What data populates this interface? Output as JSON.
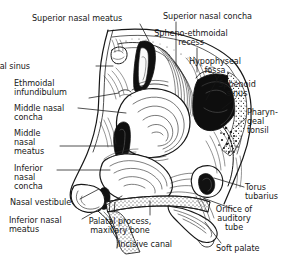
{
  "figure": {
    "style": "pen-and-ink anatomical line drawing, black on white",
    "width": 303,
    "height": 265,
    "ink_color": "#171717",
    "background_color": "#ffffff"
  },
  "labels": [
    {
      "id": "superior-nasal-meatus",
      "text": "Superior nasal meatus",
      "lines": [
        "Superior nasal meatus"
      ],
      "align": "left",
      "x": 32,
      "y": 14,
      "leader": {
        "from": [
          140,
          24
        ],
        "to": [
          149,
          41
        ]
      }
    },
    {
      "id": "superior-nasal-concha",
      "text": "Superior nasal concha",
      "lines": [
        "Superior nasal concha"
      ],
      "align": "left",
      "x": 163,
      "y": 12,
      "leader": {
        "from": [
          176,
          22
        ],
        "to": [
          176,
          66
        ]
      }
    },
    {
      "id": "spheno-ethmoidal-recess",
      "text": "Spheno-ethmoidal recess",
      "lines": [
        "Spheno-ethmoidal",
        "recess"
      ],
      "align": "center",
      "x": 191,
      "y": 29,
      "leader": {
        "from": [
          197,
          48
        ],
        "to": [
          197,
          72
        ]
      }
    },
    {
      "id": "hypophyseal-fossa",
      "text": "Hypophyseal fossa",
      "lines": [
        "Hypophyseal",
        "fossa"
      ],
      "align": "center",
      "x": 215,
      "y": 57,
      "leader": {
        "from": [
          219,
          76
        ],
        "to": [
          206,
          100
        ]
      }
    },
    {
      "id": "sphenoid-sinus",
      "text": "Sphenoid sinus",
      "lines": [
        "Sphenoid",
        "sinus"
      ],
      "align": "center",
      "x": 237,
      "y": 80,
      "leader": {
        "from": [
          236,
          98
        ],
        "to": [
          222,
          109
        ]
      }
    },
    {
      "id": "pharyngeal-tonsil",
      "text": "Pharyngeal tonsil",
      "lines": [
        "Pharyn-",
        "geal",
        "tonsil"
      ],
      "align": "left",
      "x": 247,
      "y": 108,
      "leader": {
        "from": [
          246,
          118
        ],
        "to": [
          236,
          127
        ]
      }
    },
    {
      "id": "torus-tubarius",
      "text": "Torus tubarius",
      "lines": [
        "Torus",
        "tubarius"
      ],
      "align": "left",
      "x": 245,
      "y": 183,
      "leader": {
        "from": [
          244,
          187
        ],
        "to": [
          214,
          178
        ]
      }
    },
    {
      "id": "orifice-of-auditory-tube",
      "text": "Orifice of auditory tube",
      "lines": [
        "Orifice of",
        "auditory",
        "tube"
      ],
      "align": "center",
      "x": 234,
      "y": 205,
      "leader": {
        "from": [
          233,
          209
        ],
        "to": [
          203,
          198
        ]
      }
    },
    {
      "id": "soft-palate",
      "text": "Soft palate",
      "lines": [
        "Soft palate"
      ],
      "align": "left",
      "x": 216,
      "y": 244,
      "leader": {
        "from": [
          221,
          243
        ],
        "to": [
          205,
          222
        ]
      }
    },
    {
      "id": "frontal-sinus",
      "text": "Frontal sinus",
      "lines": [
        "Frontal sinus"
      ],
      "align": "right",
      "x": 30,
      "y": 62,
      "leader": {
        "from": [
          96,
          66
        ],
        "to": [
          113,
          66
        ]
      }
    },
    {
      "id": "ethmoidal-infundibulum",
      "text": "Ethmoidal infundibulum",
      "lines": [
        "Ethmoidal",
        "infundibulum"
      ],
      "align": "left",
      "x": 14,
      "y": 79,
      "leader": {
        "from": [
          89,
          98
        ],
        "to": [
          119,
          93
        ]
      }
    },
    {
      "id": "middle-nasal-concha",
      "text": "Middle nasal concha",
      "lines": [
        "Middle nasal",
        "concha"
      ],
      "align": "left",
      "x": 14,
      "y": 104,
      "leader": {
        "from": [
          78,
          108
        ],
        "to": [
          126,
          113
        ]
      }
    },
    {
      "id": "middle-nasal-meatus",
      "text": "Middle nasal meatus",
      "lines": [
        "Middle",
        "nasal",
        "meatus"
      ],
      "align": "left",
      "x": 14,
      "y": 129,
      "leader": {
        "from": [
          60,
          146
        ],
        "to": [
          124,
          146
        ]
      }
    },
    {
      "id": "inferior-nasal-concha",
      "text": "Inferior nasal concha",
      "lines": [
        "Inferior",
        "nasal",
        "concha"
      ],
      "align": "left",
      "x": 14,
      "y": 164,
      "leader": {
        "from": [
          57,
          170
        ],
        "to": [
          110,
          170
        ]
      }
    },
    {
      "id": "nasal-vestibule",
      "text": "Nasal vestibule",
      "lines": [
        "Nasal vestibule"
      ],
      "align": "left",
      "x": 10,
      "y": 198,
      "leader": {
        "from": [
          80,
          199
        ],
        "to": [
          99,
          189
        ]
      }
    },
    {
      "id": "inferior-nasal-meatus",
      "text": "Inferior nasal meatus",
      "lines": [
        "Inferior nasal",
        "meatus"
      ],
      "align": "left",
      "x": 9,
      "y": 216,
      "leader": {
        "from": [
          82,
          219
        ],
        "to": [
          122,
          196
        ]
      }
    },
    {
      "id": "palatal-process-maxillary-bone",
      "text": "Palatal process, maxillary bone",
      "lines": [
        "Palatal process,",
        "maxillary bone"
      ],
      "align": "center",
      "x": 120,
      "y": 217,
      "leader": {
        "from": [
          150,
          215
        ],
        "to": [
          150,
          201
        ]
      }
    },
    {
      "id": "incisive-canal",
      "text": "Incisive canal",
      "lines": [
        "Incisive canal"
      ],
      "align": "left",
      "x": 118,
      "y": 240,
      "leader": {
        "from": [
          117,
          239
        ],
        "to": [
          110,
          228
        ]
      }
    }
  ],
  "anatomy_structures": [
    "frontal sinus",
    "ethmoidal infundibulum",
    "superior nasal concha",
    "superior nasal meatus",
    "middle nasal concha",
    "middle nasal meatus",
    "inferior nasal concha",
    "inferior nasal meatus",
    "spheno-ethmoidal recess",
    "hypophyseal fossa",
    "sphenoid sinus",
    "pharyngeal tonsil",
    "torus tubarius",
    "orifice of auditory tube",
    "soft palate",
    "nasal vestibule",
    "palatal process of maxillary bone",
    "incisive canal"
  ]
}
